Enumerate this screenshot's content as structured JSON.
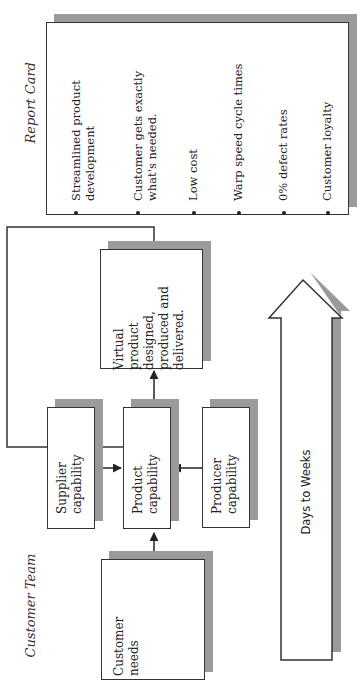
{
  "report_card": {
    "title": "Report Card",
    "items": [
      {
        "line1": "Streamlined product",
        "line2": "development"
      },
      {
        "line1": "Customer gets exactly",
        "line2": "what's needed."
      },
      {
        "line1": "Low cost",
        "line2": ""
      },
      {
        "line1": "Warp speed cycle times",
        "line2": ""
      },
      {
        "line1": "0% defect rates",
        "line2": ""
      },
      {
        "line1": "Customer loyalty",
        "line2": ""
      }
    ]
  },
  "team_label": "Customer Team",
  "boxes": {
    "virtual": {
      "lines": [
        "Virtual",
        "product",
        "designed,",
        "produced and",
        "delivered."
      ]
    },
    "supplier": {
      "lines": [
        "Supplier",
        "capability"
      ]
    },
    "product": {
      "lines": [
        "Product",
        "capability"
      ]
    },
    "producer": {
      "lines": [
        "Producer",
        "capability"
      ]
    },
    "customer_needs": {
      "lines": [
        "Customer",
        "needs"
      ]
    }
  },
  "timeline_arrow": {
    "label": "Days to Weeks"
  },
  "colors": {
    "shadow": "#9a9a9a",
    "stroke": "#333333",
    "background": "#ffffff"
  }
}
